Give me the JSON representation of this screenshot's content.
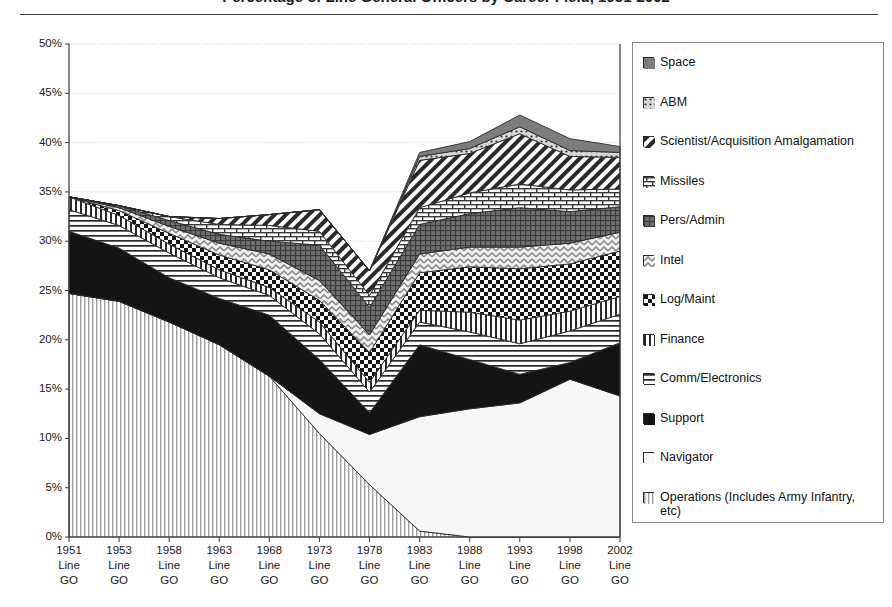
{
  "title": "Percentage of Line General Officers by Career Field, 1951-2002",
  "chart_data": {
    "type": "area",
    "stacked": true,
    "title": "Percentage of Line General Officers by Career Field, 1951-2002",
    "xlabel": "",
    "ylabel": "",
    "ylim": [
      0,
      50
    ],
    "yticks": [
      0,
      5,
      10,
      15,
      20,
      25,
      30,
      35,
      40,
      45,
      50
    ],
    "ytick_labels": [
      "0%",
      "5%",
      "10%",
      "15%",
      "20%",
      "25%",
      "30%",
      "35%",
      "40%",
      "45%",
      "50%"
    ],
    "grid": true,
    "legend_position": "right",
    "categories": [
      "1951",
      "1953",
      "1958",
      "1963",
      "1968",
      "1973",
      "1978",
      "1983",
      "1988",
      "1993",
      "1998",
      "2002"
    ],
    "category_sublabels": [
      "Line GO",
      "Line GO",
      "Line GO",
      "Line GO",
      "Line GO",
      "Line GO",
      "Line GO",
      "Line GO",
      "Line GO",
      "Line GO",
      "Line GO",
      "Line GO"
    ],
    "stack_order_bottom_to_top": [
      "Operations (Includes Army Infantry, etc)",
      "Navigator",
      "Support",
      "Comm/Electronics",
      "Finance",
      "Log/Maint",
      "Intel",
      "Pers/Admin",
      "Missiles",
      "Scientist/Acquisition Amalgamation",
      "ABM",
      "Space"
    ],
    "series": [
      {
        "name": "Operations (Includes Army Infantry, etc)",
        "pattern": "vertical-lines-light",
        "values": [
          24.7,
          23.9,
          21.8,
          19.5,
          16.3,
          10.5,
          5.3,
          0.6,
          0.0,
          0.0,
          0.0,
          0.0
        ]
      },
      {
        "name": "Navigator",
        "pattern": "solid-white",
        "values": [
          0.0,
          0.0,
          0.0,
          0.0,
          0.0,
          2.0,
          5.1,
          11.6,
          13.0,
          13.6,
          16.0,
          14.3
        ]
      },
      {
        "name": "Support",
        "pattern": "solid-black",
        "values": [
          6.3,
          5.4,
          4.5,
          4.7,
          6.2,
          5.5,
          2.2,
          7.3,
          5.0,
          2.9,
          1.7,
          5.4
        ]
      },
      {
        "name": "Comm/Electronics",
        "pattern": "horizontal-lines",
        "values": [
          2.2,
          2.3,
          2.5,
          2.1,
          2.0,
          2.6,
          2.1,
          2.3,
          2.8,
          3.1,
          3.2,
          2.9
        ]
      },
      {
        "name": "Finance",
        "pattern": "vertical-lines-bold",
        "values": [
          1.3,
          1.0,
          0.9,
          0.8,
          0.8,
          1.2,
          1.0,
          1.2,
          2.0,
          2.4,
          2.0,
          1.8
        ]
      },
      {
        "name": "Log/Maint",
        "pattern": "checkerboard-black",
        "values": [
          0.0,
          0.5,
          1.1,
          1.5,
          1.8,
          2.2,
          3.0,
          3.8,
          4.6,
          5.2,
          4.8,
          4.6
        ]
      },
      {
        "name": "Intel",
        "pattern": "zigzag-gray",
        "values": [
          0.0,
          0.3,
          0.7,
          1.2,
          1.6,
          2.0,
          1.8,
          1.9,
          2.0,
          2.2,
          2.1,
          1.9
        ]
      },
      {
        "name": "Pers/Admin",
        "pattern": "grid-dark-gray",
        "values": [
          0.0,
          0.2,
          0.6,
          0.9,
          1.3,
          3.6,
          2.8,
          3.0,
          3.4,
          4.0,
          3.2,
          2.6
        ]
      },
      {
        "name": "Missiles",
        "pattern": "brick",
        "values": [
          0.0,
          0.0,
          0.4,
          1.0,
          1.6,
          1.4,
          1.2,
          1.7,
          2.1,
          2.4,
          2.2,
          1.8
        ]
      },
      {
        "name": "Scientist/Acquisition Amalgamation",
        "pattern": "diagonal-stripes",
        "values": [
          0.0,
          0.0,
          0.0,
          0.6,
          1.1,
          2.2,
          2.5,
          4.8,
          4.0,
          5.1,
          3.4,
          3.2
        ]
      },
      {
        "name": "ABM",
        "pattern": "dotted-gray",
        "values": [
          0.0,
          0.0,
          0.0,
          0.0,
          0.0,
          0.0,
          0.0,
          0.4,
          0.5,
          0.7,
          0.6,
          0.5
        ]
      },
      {
        "name": "Space",
        "pattern": "solid-dark-gray",
        "values": [
          0.0,
          0.0,
          0.0,
          0.0,
          0.0,
          0.0,
          0.0,
          0.4,
          0.7,
          1.2,
          1.2,
          0.6
        ]
      }
    ],
    "totals": [
      34.5,
      33.6,
      32.5,
      32.3,
      32.7,
      33.2,
      27.0,
      39.0,
      40.1,
      42.8,
      40.4,
      39.6
    ],
    "annotations": []
  },
  "legend": {
    "items": [
      {
        "label": "Space",
        "pattern": "solid-dark-gray"
      },
      {
        "label": "ABM",
        "pattern": "dotted-gray"
      },
      {
        "label": "Scientist/Acquisition Amalgamation",
        "pattern": "diagonal-stripes"
      },
      {
        "label": "Missiles",
        "pattern": "brick"
      },
      {
        "label": "Pers/Admin",
        "pattern": "grid-dark-gray"
      },
      {
        "label": "Intel",
        "pattern": "zigzag-gray"
      },
      {
        "label": "Log/Maint",
        "pattern": "checkerboard-black"
      },
      {
        "label": "Finance",
        "pattern": "vertical-lines-bold"
      },
      {
        "label": "Comm/Electronics",
        "pattern": "horizontal-lines"
      },
      {
        "label": "Support",
        "pattern": "solid-black"
      },
      {
        "label": "Navigator",
        "pattern": "solid-white"
      },
      {
        "label": "Operations (Includes Army Infantry, etc)",
        "pattern": "vertical-lines-light"
      }
    ]
  },
  "colors": {
    "axis": "#3a3a3a",
    "grid": "#c8c8c8",
    "text": "#111111",
    "dark_gray": "#7a7a7a",
    "mid_gray": "#9a9a9a",
    "black": "#111111",
    "white": "#fafafa"
  }
}
